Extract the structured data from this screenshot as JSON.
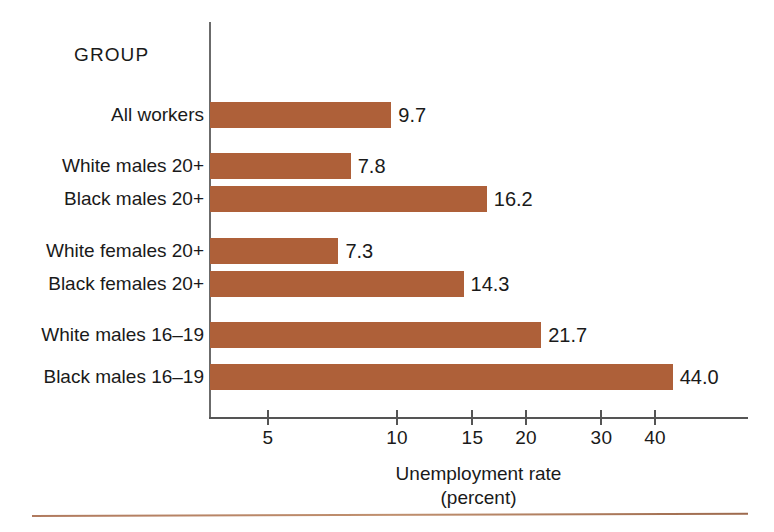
{
  "chart_data": {
    "type": "bar",
    "orientation": "horizontal",
    "title": "",
    "group_header": "GROUP",
    "xlabel": "Unemployment rate",
    "xlabel_sub": "(percent)",
    "ylabel": "",
    "scale": "log",
    "xlim": [
      3.6,
      49
    ],
    "grid": false,
    "legend": null,
    "bar_color": "#AE6039",
    "axis_color": "#555555",
    "text_color": "#1a1a1a",
    "tick_labels": [
      "5",
      "10",
      "15",
      "20",
      "30",
      "40"
    ],
    "ticks": [
      5,
      10,
      15,
      20,
      30,
      40
    ],
    "categories": [
      "All workers",
      "White males 20+",
      "Black males 20+",
      "White females 20+",
      "Black females 20+",
      "White males 16–19",
      "Black males 16–19"
    ],
    "values": [
      9.7,
      7.8,
      16.2,
      7.3,
      14.3,
      21.7,
      44.0
    ],
    "value_labels": [
      "9.7",
      "7.8",
      "16.2",
      "7.3",
      "14.3",
      "21.7",
      "44.0"
    ],
    "bars": [
      {
        "label": "All workers",
        "value": 9.7,
        "value_label": "9.7",
        "top": 102
      },
      {
        "label": "White males 20+",
        "value": 7.8,
        "value_label": "7.8",
        "top": 153
      },
      {
        "label": "Black males 20+",
        "value": 16.2,
        "value_label": "16.2",
        "top": 186
      },
      {
        "label": "White females 20+",
        "value": 7.3,
        "value_label": "7.3",
        "top": 238
      },
      {
        "label": "Black females 20+",
        "value": 14.3,
        "value_label": "14.3",
        "top": 271
      },
      {
        "label": "White males 16–19",
        "value": 21.7,
        "value_label": "21.7",
        "top": 322
      },
      {
        "label": "Black males 16–19",
        "value": 44.0,
        "value_label": "44.0",
        "top": 364
      }
    ]
  }
}
